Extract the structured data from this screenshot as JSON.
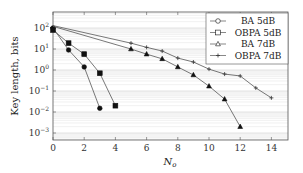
{
  "chart_data": {
    "type": "line",
    "title": "",
    "xlabel": "N_o",
    "ylabel": "Key length, bits",
    "xlim": [
      0,
      15
    ],
    "ylim": [
      0.0005,
      200
    ],
    "yscale": "log",
    "grid": "horizontal minor gridlines (light gray)",
    "legend_position": "upper right",
    "x_ticks": [
      "0",
      "2",
      "4",
      "6",
      "8",
      "10",
      "12",
      "14"
    ],
    "y_ticks": [
      "10^-3",
      "10^-2",
      "10^-1",
      "10^0",
      "10^1",
      "10^2"
    ],
    "series": [
      {
        "name": "BA 5dB",
        "marker": "circle",
        "x": [
          0,
          1,
          2,
          3
        ],
        "values": [
          100,
          9,
          1.4,
          0.015
        ]
      },
      {
        "name": "OBPA 5dB",
        "marker": "square",
        "x": [
          0,
          1,
          2,
          3,
          4
        ],
        "values": [
          80,
          19,
          5.7,
          0.7,
          0.02
        ]
      },
      {
        "name": "BA 7dB",
        "marker": "triangle",
        "x": [
          0,
          5,
          6,
          7,
          8,
          9,
          10,
          11,
          12
        ],
        "values": [
          120,
          10,
          5.7,
          3.4,
          1.4,
          0.58,
          0.17,
          0.041,
          0.002
        ]
      },
      {
        "name": "OBPA 7dB",
        "marker": "star",
        "x": [
          0,
          5,
          6,
          7,
          8,
          9,
          10,
          11,
          12,
          13,
          14
        ],
        "values": [
          130,
          19,
          12,
          8,
          3.7,
          2.4,
          1.1,
          0.64,
          0.52,
          0.14,
          0.047
        ]
      }
    ]
  },
  "labels": {
    "xlabel_main": "N",
    "xlabel_sub": "o",
    "ylabel": "Key length, bits"
  }
}
